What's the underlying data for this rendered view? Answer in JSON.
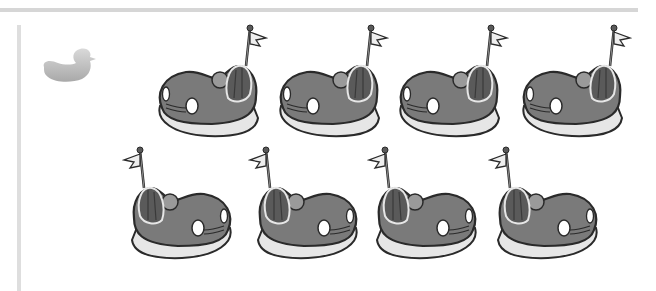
{
  "worksheet": {
    "description": "Counting worksheet: bumper cars",
    "icon": "duck-icon",
    "car_count": 8,
    "rows": [
      {
        "cars": 4,
        "flag_side": "right"
      },
      {
        "cars": 4,
        "flag_side": "left"
      }
    ],
    "colors": {
      "rule": "#d6d6d6",
      "duck": "#c8c8c8",
      "car_body": "#7a7a7a",
      "car_outline": "#2a2a2a",
      "car_base": "#e6e6e6",
      "seat": "#5a5a5a"
    }
  }
}
